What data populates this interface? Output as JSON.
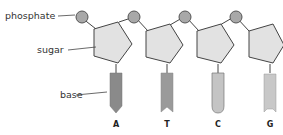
{
  "diagram": {
    "labels": {
      "phosphate": "phosphate",
      "sugar": "sugar",
      "base": "base"
    },
    "nucleotides": [
      {
        "base": "A",
        "shape": "pointed",
        "color": "#8a8a8a"
      },
      {
        "base": "T",
        "shape": "notched",
        "color": "#9a9a9a"
      },
      {
        "base": "C",
        "shape": "rounded",
        "color": "#c4c4c4"
      },
      {
        "base": "G",
        "shape": "square-notch",
        "color": "#c8c8c8"
      }
    ],
    "colors": {
      "phosphate_fill": "#a8a8a8",
      "sugar_fill": "#e2e2e2",
      "outline": "#444444"
    }
  }
}
